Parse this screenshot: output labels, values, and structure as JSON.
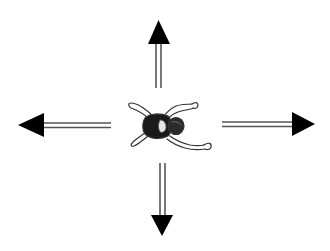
{
  "diagram": {
    "center_figure": {
      "name": "swimmer",
      "icon": "swimmer-figure-icon"
    },
    "arrows": [
      {
        "direction": "up",
        "icon": "arrow-up-icon"
      },
      {
        "direction": "down",
        "icon": "arrow-down-icon"
      },
      {
        "direction": "left",
        "icon": "arrow-left-icon"
      },
      {
        "direction": "right",
        "icon": "arrow-right-icon"
      }
    ],
    "colors": {
      "background": "#ffffff",
      "arrow_head": "#000000",
      "arrow_shaft": "#555555",
      "figure_body": "#1a1a1a",
      "figure_outline": "#333333"
    }
  }
}
